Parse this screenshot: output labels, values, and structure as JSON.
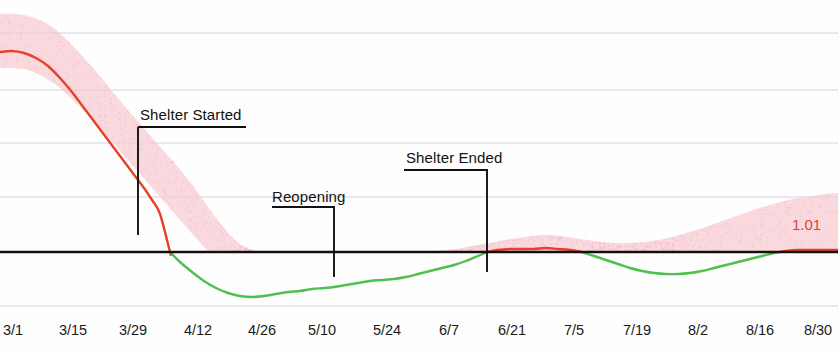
{
  "chart_data": {
    "type": "line",
    "title": "",
    "subtitle": "",
    "xlabel": "",
    "ylabel": "",
    "grid": true,
    "legend_position": "none",
    "baseline": {
      "value": 1.0,
      "color": "#111111"
    },
    "colors": {
      "above_one": "#e8402a",
      "below_one": "#4fc04f",
      "band": "#f9ccd2",
      "gridline": "#b9bfd4",
      "axis_text": "#1a1a1a",
      "annotation": "#111111"
    },
    "x_tick_labels": [
      "3/1",
      "3/15",
      "3/29",
      "4/12",
      "4/26",
      "5/10",
      "5/24",
      "6/7",
      "6/21",
      "7/5",
      "7/19",
      "8/2",
      "8/16",
      "8/30"
    ],
    "x_tick_positions_px": [
      13,
      73,
      133,
      198,
      262,
      322,
      387,
      449,
      512,
      574,
      637,
      698,
      760,
      818
    ],
    "gridline_y_px": [
      33,
      90,
      143,
      197,
      306
    ],
    "baseline_y_px": 252,
    "end_value_label": "1.01",
    "series": [
      {
        "name": "R estimate",
        "x_px": [
          0,
          12,
          24,
          36,
          48,
          60,
          72,
          84,
          96,
          108,
          120,
          132,
          144,
          152,
          160,
          170,
          180,
          192,
          204,
          216,
          228,
          240,
          252,
          264,
          276,
          288,
          300,
          312,
          324,
          334,
          346,
          358,
          370,
          382,
          394,
          406,
          418,
          430,
          442,
          454,
          466,
          478,
          487,
          498,
          510,
          522,
          534,
          546,
          558,
          570,
          582,
          594,
          606,
          618,
          630,
          642,
          654,
          666,
          678,
          690,
          702,
          714,
          726,
          738,
          750,
          762,
          774,
          786,
          798,
          810,
          822,
          834,
          838
        ],
        "y_px": [
          52,
          51,
          53,
          58,
          66,
          78,
          92,
          108,
          124,
          140,
          156,
          172,
          188,
          200,
          214,
          252,
          262,
          272,
          281,
          288,
          293,
          296,
          297,
          296,
          294,
          292,
          291,
          289,
          288,
          287,
          285,
          283,
          281,
          280,
          279,
          277,
          274,
          271,
          268,
          265,
          261,
          256,
          252,
          250,
          249,
          249,
          249,
          248,
          249,
          250,
          252,
          256,
          260,
          264,
          268,
          271,
          273,
          274,
          274,
          273,
          271,
          268,
          265,
          262,
          259,
          256,
          253,
          251,
          250,
          250,
          250,
          250,
          250
        ],
        "approx_values": [
          1.56,
          1.56,
          1.55,
          1.53,
          1.49,
          1.44,
          1.38,
          1.31,
          1.24,
          1.17,
          1.1,
          1.04,
          0.97,
          0.92,
          0.86,
          1.0,
          0.96,
          0.92,
          0.88,
          0.86,
          0.84,
          0.83,
          0.82,
          0.83,
          0.84,
          0.85,
          0.85,
          0.86,
          0.86,
          0.87,
          0.87,
          0.88,
          0.89,
          0.89,
          0.9,
          0.9,
          0.91,
          0.93,
          0.94,
          0.95,
          0.97,
          0.99,
          1.0,
          1.01,
          1.01,
          1.01,
          1.01,
          1.02,
          1.01,
          1.01,
          1.0,
          0.99,
          0.97,
          0.95,
          0.94,
          0.93,
          0.92,
          0.91,
          0.91,
          0.92,
          0.93,
          0.94,
          0.95,
          0.96,
          0.97,
          0.99,
          1.0,
          1.0,
          1.01,
          1.01,
          1.01,
          1.01,
          1.01
        ]
      }
    ],
    "band": {
      "name": "credible interval",
      "x_px": [
        0,
        14,
        28,
        42,
        56,
        70,
        84,
        98,
        112,
        126,
        140,
        154,
        168,
        182,
        196,
        210,
        224,
        238,
        252,
        266,
        280,
        294,
        308,
        322,
        336,
        350,
        364,
        378,
        392,
        406,
        420,
        434,
        448,
        462,
        476,
        490,
        504,
        518,
        532,
        546,
        560,
        574,
        588,
        602,
        616,
        630,
        644,
        658,
        672,
        686,
        700,
        714,
        728,
        742,
        756,
        770,
        784,
        798,
        812,
        826,
        838
      ],
      "upper_y_px": [
        14,
        14,
        16,
        21,
        30,
        43,
        58,
        74,
        91,
        108,
        124,
        140,
        156,
        172,
        190,
        210,
        228,
        243,
        250,
        252,
        252,
        252,
        252,
        252,
        252,
        252,
        252,
        252,
        252,
        252,
        252,
        251,
        250,
        248,
        245,
        243,
        240,
        238,
        236,
        235,
        236,
        238,
        240,
        242,
        243,
        243,
        242,
        240,
        237,
        233,
        229,
        224,
        219,
        214,
        209,
        205,
        201,
        198,
        196,
        194,
        193
      ],
      "lower_y_px": [
        68,
        68,
        70,
        76,
        85,
        97,
        111,
        126,
        142,
        158,
        174,
        190,
        206,
        222,
        238,
        252,
        252,
        252,
        252,
        252,
        252,
        252,
        252,
        252,
        252,
        252,
        252,
        252,
        252,
        252,
        252,
        252,
        252,
        252,
        252,
        252,
        252,
        252,
        252,
        252,
        252,
        252,
        252,
        252,
        252,
        252,
        252,
        252,
        252,
        252,
        252,
        252,
        252,
        252,
        252,
        252,
        252,
        252,
        252,
        252,
        252
      ]
    },
    "annotations": [
      {
        "id": "shelter-started",
        "label": "Shelter Started",
        "text_left_px": 140,
        "text_top_px": 106,
        "underline_x1_px": 138,
        "underline_x2_px": 246,
        "underline_y_px": 127,
        "pointer_x_px": 138,
        "pointer_y1_px": 127,
        "pointer_y2_px": 235
      },
      {
        "id": "reopening",
        "label": "Reopening",
        "text_left_px": 272,
        "text_top_px": 188,
        "underline_x1_px": 272,
        "underline_x2_px": 335,
        "underline_y_px": 207,
        "pointer_x_px": 334,
        "pointer_y1_px": 207,
        "pointer_y2_px": 277
      },
      {
        "id": "shelter-ended",
        "label": "Shelter Ended",
        "text_left_px": 406,
        "text_top_px": 149,
        "underline_x1_px": 404,
        "underline_x2_px": 488,
        "underline_y_px": 170,
        "pointer_x_px": 487,
        "pointer_y1_px": 170,
        "pointer_y2_px": 272
      }
    ]
  }
}
